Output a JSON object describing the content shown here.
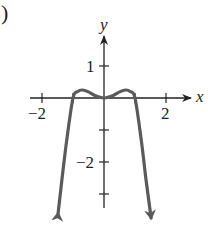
{
  "figure": {
    "part_label_fragment": ")"
  },
  "chart_data": {
    "type": "line",
    "title": "",
    "xlabel": "x",
    "ylabel": "y",
    "xlim": [
      -2.5,
      2.7
    ],
    "ylim": [
      -3.5,
      2.2
    ],
    "grid": false,
    "legend": null,
    "x_ticks": [
      -2,
      -1,
      1,
      2
    ],
    "x_tick_labels": [
      "-2",
      "2"
    ],
    "y_ticks": [
      1,
      -1,
      -2,
      -3
    ],
    "y_tick_labels": [
      "1",
      "-2"
    ],
    "annotations": [
      "arrows at both curve ends pointing downward",
      "arrowhead on positive x-axis and positive y-axis"
    ],
    "series": [
      {
        "name": "curve",
        "color": "#5a5a5a",
        "x": [
          -1.48,
          -1.35,
          -1.2,
          -1.0,
          -0.85,
          -0.7,
          -0.5,
          -0.3,
          0.0,
          0.3,
          0.5,
          0.7,
          0.85,
          1.0,
          1.2,
          1.35,
          1.52
        ],
        "y": [
          -3.6,
          -2.5,
          -1.3,
          0.0,
          0.2,
          0.25,
          0.19,
          0.08,
          0.0,
          0.08,
          0.19,
          0.25,
          0.2,
          0.0,
          -1.3,
          -2.5,
          -3.75
        ]
      }
    ],
    "key_points": {
      "local_maxima": [
        [
          -0.7,
          0.25
        ],
        [
          0.7,
          0.25
        ]
      ],
      "local_minimum": [
        0,
        0
      ],
      "x_intercepts": [
        -1,
        0,
        1
      ]
    },
    "end_behavior": "falls to -infinity as x goes to both -infinity and +infinity"
  },
  "colors": {
    "axis": "#222222",
    "curve": "#5a5a5a",
    "text": "#222222"
  }
}
